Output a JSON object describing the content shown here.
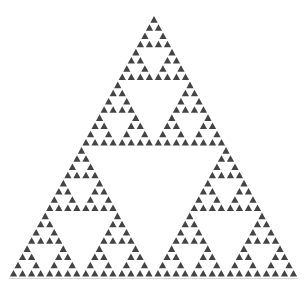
{
  "figure": {
    "depth": 5,
    "apex": [
      154,
      15
    ],
    "base_left": [
      9,
      277
    ],
    "base_right": [
      298,
      277
    ],
    "fill_color": "#444444",
    "background_color": "#ffffff",
    "baseline_color": "#d8d8d8"
  }
}
